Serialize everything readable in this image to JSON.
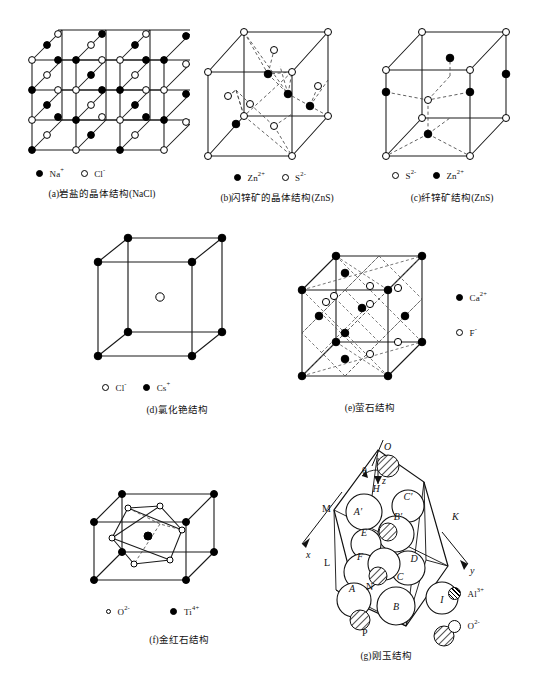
{
  "figure": {
    "title_implicit": "Crystal structures of representative ionic compounds",
    "panels": [
      {
        "id": "a",
        "caption": "(a)岩盐的晶体结构(NaCl)",
        "structure": "rock-salt",
        "legend": [
          {
            "marker": "filled-circle",
            "label": "Na",
            "charge": "+"
          },
          {
            "marker": "open-circle",
            "label": "Cl",
            "charge": "-"
          }
        ]
      },
      {
        "id": "b",
        "caption": "(b)闪锌矿的晶体结构(ZnS)",
        "structure": "zinc-blende",
        "legend": [
          {
            "marker": "filled-circle",
            "label": "Zn",
            "charge": "2+"
          },
          {
            "marker": "open-circle",
            "label": "S",
            "charge": "2-"
          }
        ]
      },
      {
        "id": "c",
        "caption": "(c)纤锌矿结构(ZnS)",
        "structure": "wurtzite",
        "legend": [
          {
            "marker": "open-circle",
            "label": "S",
            "charge": "2-"
          },
          {
            "marker": "filled-circle",
            "label": "Zn",
            "charge": "2+"
          }
        ]
      },
      {
        "id": "d",
        "caption": "(d)氯化铯结构",
        "structure": "cesium-chloride",
        "legend": [
          {
            "marker": "open-circle",
            "label": "Cl",
            "charge": "-"
          },
          {
            "marker": "filled-circle",
            "label": "Cs",
            "charge": "+"
          }
        ]
      },
      {
        "id": "e",
        "caption": "(e)萤石结构",
        "structure": "fluorite",
        "legend": [
          {
            "marker": "filled-circle",
            "label": "Ca",
            "charge": "2+"
          },
          {
            "marker": "open-circle",
            "label": "F",
            "charge": "-"
          }
        ]
      },
      {
        "id": "f",
        "caption": "(f)金红石结构",
        "structure": "rutile",
        "legend": [
          {
            "marker": "open-circle-small",
            "label": "O",
            "charge": "2-"
          },
          {
            "marker": "filled-circle",
            "label": "Ti",
            "charge": "4+"
          }
        ]
      },
      {
        "id": "g",
        "caption": "(g)刚玉结构",
        "structure": "corundum",
        "legend": [
          {
            "marker": "hatched-circle",
            "label": "Al",
            "charge": "3+"
          },
          {
            "marker": "open-circle-large",
            "label": "O",
            "charge": "2-"
          }
        ],
        "sphere_labels": [
          "A",
          "A'",
          "B",
          "B'",
          "C",
          "C'",
          "D",
          "E",
          "F",
          "H",
          "I",
          "N"
        ],
        "vertex_labels": [
          "O",
          "M",
          "K",
          "L",
          "N",
          "P"
        ],
        "axis_labels": [
          "x",
          "y",
          "z"
        ],
        "angle_label": "θ"
      }
    ]
  },
  "colors": {
    "ink": "#111111",
    "line": "#1a1a1a",
    "fill_open": "#ffffff",
    "fill_solid": "#000000",
    "paper": "#ffffff"
  }
}
